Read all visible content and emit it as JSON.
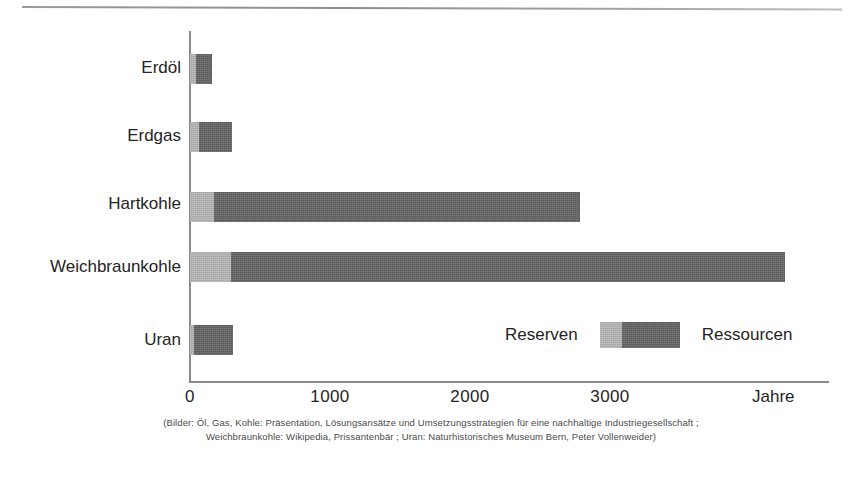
{
  "figure": {
    "unit_label": "Jahre",
    "caption_line1": "(Bilder: Öl, Gas, Kohle: Präsentation, Lösungsansätze    und Umsetzungsstrategien für eine nachhaltige Industriegesellschaft ;",
    "caption_line2": "Weichbraunkohle: Wikipedia, Prissantenbär ;  Uran: Naturhistorisches Museum Bern, Peter  Vollenweider)"
  },
  "legend": {
    "left_label": "Reserven",
    "right_label": "Ressourcen"
  },
  "colors": {
    "reserven": "#a8a8a8",
    "ressourcen": "#5a5a5a",
    "axis": "#8a8a8a",
    "text": "#242424",
    "rule": "#9a9a9a",
    "background": "#ffffff"
  },
  "chart_data": {
    "type": "bar",
    "orientation": "horizontal",
    "stacked": true,
    "title": "",
    "subtitle": "",
    "xlabel": "Jahre",
    "ylabel": "",
    "xlim": [
      0,
      4570
    ],
    "xticks": [
      0,
      1000,
      2000,
      3000
    ],
    "xticklabels": [
      "0",
      "1000",
      "2000",
      "3000"
    ],
    "grid": false,
    "legend_position": "inside-bottom-right",
    "categories": [
      "Erdöl",
      "Erdgas",
      "Hartkohle",
      "Weichbraunkohle",
      "Uran"
    ],
    "series": [
      {
        "name": "Reserven",
        "values": [
          45,
          65,
          170,
          290,
          25
        ]
      },
      {
        "name": "Ressourcen",
        "values": [
          110,
          235,
          2615,
          3960,
          285
        ]
      }
    ],
    "totals": [
      155,
      300,
      2785,
      4250,
      310
    ],
    "annotations": []
  }
}
